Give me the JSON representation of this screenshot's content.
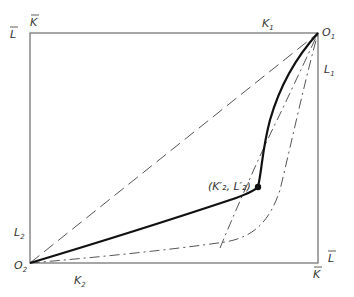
{
  "diagram": {
    "type": "edgeworth-box",
    "box": {
      "left": 30,
      "top": 33,
      "right": 318,
      "bottom": 263
    },
    "colors": {
      "frame": "#777777",
      "contract_curve": "#111111",
      "dashed": "#555555"
    },
    "labels": {
      "top_left_L": "L",
      "top_left_K": "K",
      "top_K1": "K",
      "top_K1_sub": "1",
      "origin1": "O",
      "origin1_sub": "1",
      "right_L1": "L",
      "right_L1_sub": "1",
      "left_L2": "L",
      "left_L2_sub": "2",
      "origin2": "O",
      "origin2_sub": "2",
      "bottom_K2": "K",
      "bottom_K2_sub": "2",
      "bottom_right_K": "K",
      "bottom_right_L": "L",
      "point_label": "(K′₂, L′₂)"
    },
    "point": {
      "x": 258,
      "y": 187
    }
  }
}
